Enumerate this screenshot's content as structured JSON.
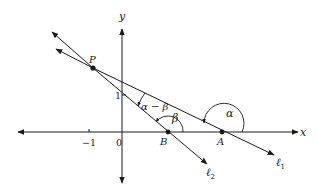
{
  "diagram": {
    "type": "coordinate-geometry",
    "axes": {
      "x_label": "x",
      "y_label": "y"
    },
    "ticks": {
      "x_neg_one": "−1",
      "origin": "0",
      "y_one": "1"
    },
    "points": {
      "P": "P",
      "A": "A",
      "B": "B"
    },
    "lines": {
      "l1": {
        "label": "ℓ",
        "subscript": "1"
      },
      "l2": {
        "label": "ℓ",
        "subscript": "2"
      }
    },
    "angles": {
      "alpha": "α",
      "beta": "β",
      "alpha_minus_beta": "α − β"
    },
    "colors": {
      "ink": "#1a1a1a",
      "background": "#ffffff"
    }
  }
}
